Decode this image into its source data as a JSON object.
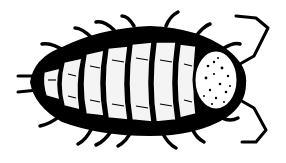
{
  "image": {
    "subject": "isopod (woodlouse) line illustration, dorsal view",
    "alt": "Black-and-white ink drawing of a woodlouse seen from above",
    "colors": {
      "ink": "#000000",
      "paper": "#ffffff",
      "highlight": "#f4f4f4"
    },
    "orientation": {
      "head": "right",
      "tail": "left"
    },
    "features": {
      "body_segments": 7,
      "legs_visible_top": 6,
      "legs_visible_bottom": 7,
      "antennae": 2,
      "uropods": 2
    }
  }
}
